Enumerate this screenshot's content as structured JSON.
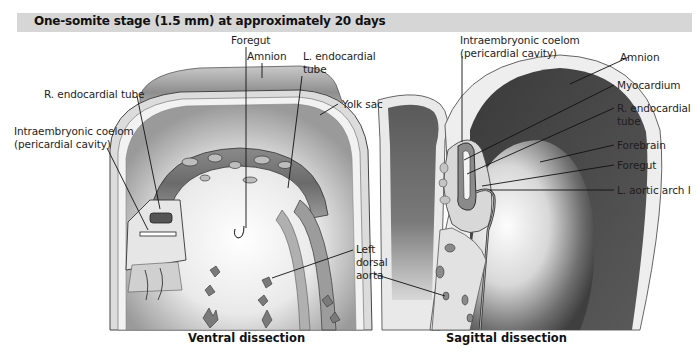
{
  "header": {
    "title": "One-somite stage (1.5 mm) at approximately 20 days"
  },
  "ventral": {
    "caption": "Ventral dissection",
    "labels": {
      "foregut": "Foregut",
      "amnion": "Amnion",
      "l_endocardial_1": "L. endocardial",
      "l_endocardial_2": "tube",
      "r_endocardial": "R. endocardial tube",
      "coelom_1": "Intraembryonic coelom",
      "coelom_2": "(pericardial cavity)",
      "yolk_sac": "Yolk sac",
      "left_dorsal_1": "Left",
      "left_dorsal_2": "dorsal",
      "left_dorsal_3": "aorta"
    }
  },
  "sagittal": {
    "caption": "Sagittal dissection",
    "labels": {
      "coelom_1": "Intraembryonic coelom",
      "coelom_2": "(pericardial cavity)",
      "amnion": "Amnion",
      "myocardium": "Myocardium",
      "r_endocardial_1": "R. endocardial",
      "r_endocardial_2": "tube",
      "forebrain": "Forebrain",
      "foregut": "Foregut",
      "l_aortic_arch": "L. aortic arch I"
    }
  },
  "colors": {
    "header_bar": "#d6d6d6",
    "tissue_light": "#e8e8e8",
    "tissue_mid": "#a8a8a8",
    "tissue_dark": "#4a4a4a"
  }
}
